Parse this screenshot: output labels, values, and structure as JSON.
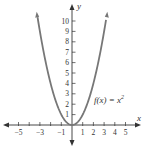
{
  "chart_data": {
    "type": "line",
    "title": "",
    "function_label": "f(x) = x",
    "function_exponent": "2",
    "xlabel": "x",
    "ylabel": "y",
    "xlim": [
      -6,
      6
    ],
    "ylim": [
      -1,
      11
    ],
    "x_ticks": [
      -5,
      -4,
      -3,
      -2,
      -1,
      1,
      2,
      3,
      4,
      5
    ],
    "x_tick_labels": [
      "-5",
      "-3",
      "-1",
      "1",
      "2",
      "3",
      "4",
      "5"
    ],
    "x_tick_label_values": [
      -5,
      -3,
      -1,
      1,
      2,
      3,
      4,
      5
    ],
    "y_ticks": [
      1,
      2,
      3,
      4,
      5,
      6,
      7,
      8,
      9,
      10
    ],
    "y_tick_labels": [
      "1",
      "2",
      "3",
      "4",
      "5",
      "6",
      "7",
      "8",
      "9",
      "10"
    ],
    "grid": false,
    "series": [
      {
        "name": "f(x) = x^2",
        "x": [
          -3.3,
          -3,
          -2.5,
          -2,
          -1.5,
          -1,
          -0.5,
          0,
          0.5,
          1,
          1.5,
          2,
          2.5,
          3,
          3.3
        ],
        "y": [
          10.89,
          9,
          6.25,
          4,
          2.25,
          1,
          0.25,
          0,
          0.25,
          1,
          2.25,
          4,
          6.25,
          9,
          10.89
        ]
      }
    ],
    "colors": {
      "curve": "#777777",
      "axes": "#333333"
    }
  }
}
